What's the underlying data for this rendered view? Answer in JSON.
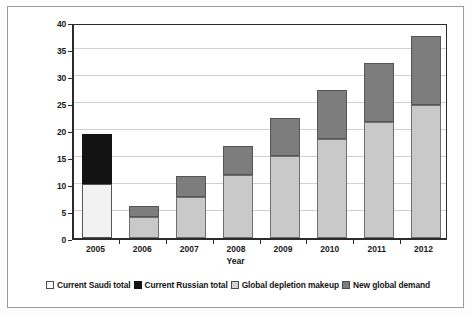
{
  "figure": {
    "background": "#ffffff",
    "frame_color": "#9a9a9a"
  },
  "chart_data": {
    "type": "bar",
    "stacked": true,
    "title": "",
    "xlabel": "Year",
    "ylabel": "Millions of barrels per day (Mb/d) required",
    "categories": [
      "2005",
      "2006",
      "2007",
      "2008",
      "2009",
      "2010",
      "2011",
      "2012"
    ],
    "ylim": [
      0,
      40
    ],
    "yticks": [
      0,
      5,
      10,
      15,
      20,
      25,
      30,
      35,
      40
    ],
    "ytick_labels": [
      "0",
      "5",
      "10",
      "15",
      "20",
      "25",
      "30",
      "35",
      "40"
    ],
    "grid": true,
    "legend_position": "bottom",
    "series": [
      {
        "name": "Current Saudi total",
        "color": "#f2f2f2",
        "values": [
          10.0,
          0,
          0,
          0,
          0,
          0,
          0,
          0
        ]
      },
      {
        "name": "Current Russian total",
        "color": "#131313",
        "values": [
          9.3,
          0,
          0,
          0,
          0,
          0,
          0,
          0
        ]
      },
      {
        "name": "Global depletion makeup",
        "color": "#c9c9c9",
        "values": [
          0,
          3.8,
          7.6,
          11.6,
          15.2,
          18.4,
          21.5,
          24.6
        ]
      },
      {
        "name": "New global demand",
        "color": "#7d7d7d",
        "values": [
          0,
          2.2,
          3.8,
          5.5,
          7.1,
          9.0,
          11.0,
          12.9
        ]
      }
    ],
    "totals": [
      19.3,
      6.0,
      11.4,
      17.1,
      22.3,
      27.4,
      32.5,
      37.5
    ]
  },
  "legend": {
    "items": [
      {
        "label": "Current Saudi total",
        "swatch": "white-square-swatch"
      },
      {
        "label": "Current Russian total",
        "swatch": "black-square-swatch"
      },
      {
        "label": "Global depletion makeup",
        "swatch": "light-gray-square-swatch"
      },
      {
        "label": "New global demand",
        "swatch": "dark-gray-square-swatch"
      }
    ]
  }
}
